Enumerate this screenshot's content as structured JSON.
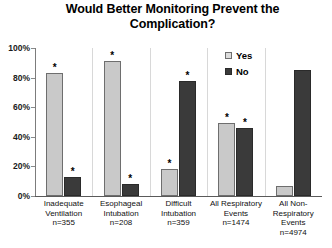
{
  "chart_data": {
    "type": "bar",
    "title": "Would Better Monitoring Prevent the Complication?",
    "title_line1": "Would Better Monitoring Prevent the",
    "title_line2": "Complication?",
    "xlabel": "",
    "ylabel": "",
    "ylim": [
      0,
      100
    ],
    "y_tick_labels": [
      "0%",
      "20%",
      "40%",
      "60%",
      "80%",
      "100%"
    ],
    "y_tick_values": [
      0,
      20,
      40,
      60,
      80,
      100
    ],
    "grid": false,
    "legend_position": "upper-right-inside",
    "categories": [
      "Inadequate\nVentilation",
      "Esophageal\nIntubation",
      "Difficult\nIntubation",
      "All Respiratory\nEvents",
      "All Non-\nRespiratory\nEvents"
    ],
    "category_counts": [
      "n=355",
      "n=208",
      "n=359",
      "n=1474",
      "n=4974"
    ],
    "series": [
      {
        "name": "Yes",
        "color": "#c9c9c9",
        "values": [
          83,
          91,
          18,
          49,
          7
        ]
      },
      {
        "name": "No",
        "color": "#3a3a3a",
        "values": [
          13,
          8,
          78,
          46,
          85
        ]
      }
    ],
    "annotations": {
      "significance_marker": "*",
      "marked": [
        {
          "category": 0,
          "series": "Yes"
        },
        {
          "category": 0,
          "series": "No"
        },
        {
          "category": 1,
          "series": "Yes"
        },
        {
          "category": 1,
          "series": "No"
        },
        {
          "category": 2,
          "series": "Yes"
        },
        {
          "category": 2,
          "series": "No"
        },
        {
          "category": 3,
          "series": "Yes"
        },
        {
          "category": 3,
          "series": "No"
        }
      ]
    }
  },
  "legend": {
    "items": [
      {
        "label": "Yes",
        "swatch": "light-gray-swatch"
      },
      {
        "label": "No",
        "swatch": "dark-gray-swatch"
      }
    ]
  }
}
